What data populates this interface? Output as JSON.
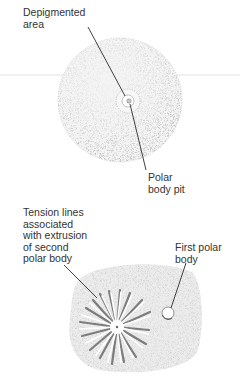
{
  "figure": {
    "top_panel": {
      "subject": "oocyte sphere",
      "labels": {
        "depigmented_area": "Depigmented\narea",
        "polar_body_pit": "Polar\nbody pit"
      }
    },
    "bottom_panel": {
      "subject": "surface with polar body extrusion",
      "labels": {
        "tension_lines": "Tension lines\nassociated\nwith extrusion\nof second\npolar body",
        "first_polar_body": "First polar\nbody"
      }
    },
    "colors": {
      "ink": "#2b2b2b",
      "stipple": "#8a8a8a",
      "blob_fill": "#e4e4e4",
      "guide_line": "#d6d6d6"
    }
  }
}
